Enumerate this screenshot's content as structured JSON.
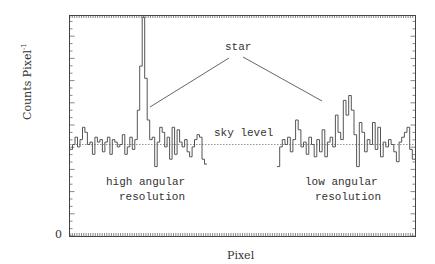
{
  "chart_data": {
    "type": "line",
    "subtype": "step-histogram",
    "title": "",
    "xlabel": "Pixel",
    "ylabel": "Counts Pixel",
    "ylabel_superscript": "-1",
    "y_tick_labels": [
      "0"
    ],
    "grid": false,
    "legend": null,
    "reference_line": {
      "label": "sky level",
      "style": "dotted",
      "y": 0
    },
    "annotations": [
      {
        "text": "star",
        "points_to": [
          "high-resolution peak",
          "low-resolution peak"
        ]
      },
      {
        "text": "high angular resolution"
      },
      {
        "text": "low angular resolution"
      }
    ],
    "series": [
      {
        "name": "high angular resolution",
        "note": "values relative to sky level (positive = above), arbitrary units",
        "values": [
          -2,
          0,
          3,
          -1,
          2,
          7,
          5,
          0,
          1,
          -4,
          3,
          1,
          2,
          -3,
          1,
          3,
          -4,
          2,
          1,
          -1,
          0,
          4,
          -4,
          -1,
          3,
          -2,
          2,
          14,
          32,
          52,
          27,
          10,
          2,
          3,
          -9,
          1,
          7,
          5,
          -1,
          3,
          -6,
          7,
          -4,
          6,
          1,
          -1,
          2,
          -3,
          -5,
          -1,
          2,
          4,
          3,
          -6,
          -8
        ]
      },
      {
        "name": "low angular resolution",
        "note": "values relative to sky level (positive = above), arbitrary units",
        "values": [
          -9,
          -1,
          2,
          0,
          3,
          -3,
          2,
          10,
          6,
          -1,
          1,
          -4,
          3,
          0,
          -5,
          2,
          -3,
          6,
          -5,
          1,
          3,
          -1,
          12,
          5,
          2,
          18,
          12,
          20,
          14,
          4,
          -9,
          9,
          5,
          -3,
          2,
          0,
          9,
          -2,
          7,
          -5,
          1,
          -1,
          2,
          0,
          -3,
          -7,
          1,
          3,
          5,
          7,
          -2,
          -6
        ]
      }
    ]
  },
  "labels": {
    "star": "star",
    "sky_level": "sky level",
    "high_res_line1": "high angular",
    "high_res_line2": "resolution",
    "low_res_line1": "low angular",
    "low_res_line2": "resolution",
    "y_zero": "0",
    "x_axis_title": "Pixel",
    "y_axis_title": "Counts Pixel",
    "y_axis_sup": "-1"
  },
  "colors": {
    "frame": "#444444",
    "trace": "#555555",
    "sky_line": "#777777",
    "pointer": "#555555"
  }
}
